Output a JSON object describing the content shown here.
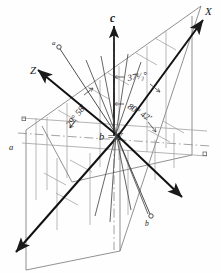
{
  "figure": {
    "kind": "crystallographic-axes-diagram",
    "background_color": "#fefefe",
    "ink_color": "#1a1a1a",
    "plane_line_color": "#8a8a8a",
    "hatch_color": "#9a9a9a"
  },
  "axis_labels": {
    "x": "X",
    "z": "Z",
    "c": "c",
    "origin": "b = Y",
    "a_left": "a",
    "a_upper": "a",
    "b_lower": "b"
  },
  "angles": [
    {
      "id": "angle-right-upper",
      "text": "37¹⁄₂°"
    },
    {
      "id": "angle-right-lower",
      "text": "80° 42'"
    },
    {
      "id": "angle-left",
      "text": "29° 58'"
    }
  ],
  "markers": {
    "node_small_circle": "○",
    "node_small_square": "□"
  },
  "caption_fragment": ""
}
